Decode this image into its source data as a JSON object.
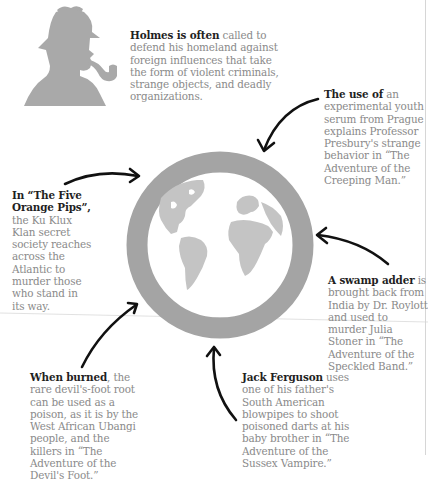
{
  "intro": {
    "lead": "Holmes is often",
    "body": " called to defend his homeland against foreign influences that take the form of violent criminals, strange objects, and deadly organizations."
  },
  "callouts": [
    {
      "id": "creeping-man",
      "lead": "The use of",
      "body": " an experimental youth serum from Prague explains Professor Presbury's strange behavior in “The Adventure of the Creeping Man.”"
    },
    {
      "id": "five-orange-pips",
      "lead": "In “The Five Orange Pips”,",
      "body": " the Ku Klux Klan secret society reaches across the Atlantic to murder those who stand in its way."
    },
    {
      "id": "speckled-band",
      "lead": "A swamp adder",
      "body": " is brought back from India by Dr. Roylott and used to murder Julia Stoner in “The Adventure of the Speckled Band.”"
    },
    {
      "id": "devils-foot",
      "lead": "When burned",
      "body": ", the rare devil's-foot root can be used as a poison, as it is by the West African Ubangi people, and the killers in “The Adventure of the Devil's Foot.”"
    },
    {
      "id": "sussex-vampire",
      "lead": "Jack Ferguson",
      "body": " uses one of his father's South American blowpipes to shoot poisoned darts at his baby brother in “The Adventure of the Sussex Vampire.”"
    }
  ],
  "icons": {
    "silhouette": "sherlock-holmes-silhouette-icon",
    "globe": "globe-icon",
    "arrows": "hand-drawn-arrow-icon"
  },
  "colors": {
    "silhouette": "#a9a9a9",
    "ring": "#a4a4a4",
    "continents": "#c4c4c4",
    "arrow": "#111111",
    "lead_text": "#1f1f1f",
    "body_text": "#8a8a8a"
  }
}
